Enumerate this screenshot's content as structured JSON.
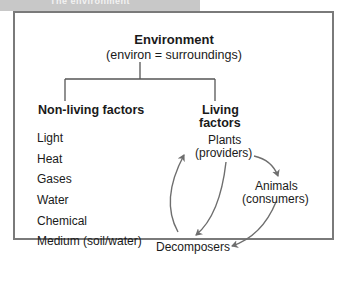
{
  "header": {
    "title": "The environment"
  },
  "diagram": {
    "root": {
      "title": "Environment",
      "subtitle": "(environ = surroundings)"
    },
    "non_living": {
      "heading": "Non-living factors",
      "items": [
        "Light",
        "Heat",
        "Gases",
        "Water",
        "Chemical",
        "Medium (soil/water)"
      ]
    },
    "living": {
      "heading_line1": "Living",
      "heading_line2": "factors",
      "nodes": {
        "plants": {
          "line1": "Plants",
          "line2": "(providers)"
        },
        "animals": {
          "line1": "Animals",
          "line2": "(consumers)"
        },
        "decomposers": {
          "line1": "Decomposers"
        }
      },
      "cycle": [
        {
          "from": "Plants",
          "to": "Animals"
        },
        {
          "from": "Animals",
          "to": "Decomposers"
        },
        {
          "from": "Plants",
          "to": "Decomposers"
        },
        {
          "from": "Decomposers",
          "to": "Plants"
        }
      ]
    },
    "colors": {
      "frame": "#7a7a7a",
      "arrows": "#6e6e6e",
      "tree_lines": "#555555",
      "header": "#c8c8c8"
    }
  }
}
